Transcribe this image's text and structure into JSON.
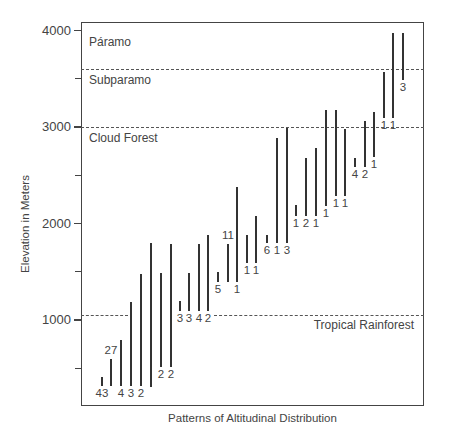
{
  "chart_data": {
    "type": "range-bar",
    "title": "",
    "xlabel": "Patterns of Altitudinal Distribution",
    "ylabel": "Elevation in Meters",
    "ylim": [
      110,
      4080
    ],
    "yticks": [
      {
        "value": 4000,
        "label": "4000"
      },
      {
        "value": 3500,
        "label": ""
      },
      {
        "value": 3000,
        "label": "3000"
      },
      {
        "value": 2500,
        "label": ""
      },
      {
        "value": 2000,
        "label": "2000"
      },
      {
        "value": 1500,
        "label": ""
      },
      {
        "value": 1000,
        "label": "1000"
      },
      {
        "value": 500,
        "label": ""
      }
    ],
    "grid": false,
    "zones": [
      {
        "name": "Páramo",
        "label_elev": 3870,
        "label_side": "left"
      },
      {
        "name": "Subparamo",
        "boundary": 3600,
        "label_elev": 3480,
        "label_side": "left"
      },
      {
        "name": "Cloud Forest",
        "boundary": 3000,
        "label_elev": 2880,
        "label_side": "left"
      },
      {
        "name": "Tropical Rainforest",
        "boundary": 1050,
        "label_elev": 940,
        "label_side": "right"
      }
    ],
    "zone_boundaries_segments": [
      {
        "elev": 3600,
        "segments": [
          [
            81,
            424
          ]
        ]
      },
      {
        "elev": 3000,
        "segments": [
          [
            81,
            424
          ]
        ]
      },
      {
        "elev": 1050,
        "segments": [
          [
            81,
            128
          ],
          [
            214,
            424
          ]
        ]
      }
    ],
    "series": [
      {
        "x": 102,
        "low": 320,
        "high": 410,
        "label": "43",
        "label_pos": "below"
      },
      {
        "x": 111,
        "low": 320,
        "high": 600,
        "label": "27",
        "label_pos": "above"
      },
      {
        "x": 121,
        "low": 320,
        "high": 790,
        "label": "4",
        "label_pos": "below"
      },
      {
        "x": 131,
        "low": 320,
        "high": 1190,
        "label": "3",
        "label_pos": "below"
      },
      {
        "x": 141,
        "low": 320,
        "high": 1480,
        "label": "2",
        "label_pos": "below"
      },
      {
        "x": 151,
        "low": 310,
        "high": 1800,
        "label": "",
        "label_pos": "below"
      },
      {
        "x": 161,
        "low": 510,
        "high": 1490,
        "label": "2",
        "label_pos": "below"
      },
      {
        "x": 171,
        "low": 510,
        "high": 1790,
        "label": "2",
        "label_pos": "below"
      },
      {
        "x": 180,
        "low": 1090,
        "high": 1200,
        "label": "3",
        "label_pos": "below"
      },
      {
        "x": 189,
        "low": 1090,
        "high": 1490,
        "label": "3",
        "label_pos": "below"
      },
      {
        "x": 199,
        "low": 1090,
        "high": 1790,
        "label": "4",
        "label_pos": "below"
      },
      {
        "x": 208,
        "low": 1090,
        "high": 1880,
        "label": "2",
        "label_pos": "below"
      },
      {
        "x": 218,
        "low": 1390,
        "high": 1500,
        "label": "5",
        "label_pos": "below"
      },
      {
        "x": 228,
        "low": 1390,
        "high": 1790,
        "label": "11",
        "label_pos": "above"
      },
      {
        "x": 237,
        "low": 1390,
        "high": 2380,
        "label": "1",
        "label_pos": "below"
      },
      {
        "x": 247,
        "low": 1590,
        "high": 1880,
        "label": "1",
        "label_pos": "below"
      },
      {
        "x": 256,
        "low": 1590,
        "high": 2080,
        "label": "1",
        "label_pos": "below"
      },
      {
        "x": 267,
        "low": 1800,
        "high": 1880,
        "label": "6",
        "label_pos": "below"
      },
      {
        "x": 277,
        "low": 1800,
        "high": 2890,
        "label": "1",
        "label_pos": "below"
      },
      {
        "x": 287,
        "low": 1800,
        "high": 2990,
        "label": "3",
        "label_pos": "below"
      },
      {
        "x": 296,
        "low": 2080,
        "high": 2190,
        "label": "1",
        "label_pos": "below"
      },
      {
        "x": 306,
        "low": 2080,
        "high": 2680,
        "label": "2",
        "label_pos": "below"
      },
      {
        "x": 316,
        "low": 2080,
        "high": 2780,
        "label": "1",
        "label_pos": "below"
      },
      {
        "x": 326,
        "low": 2180,
        "high": 3180,
        "label": "1",
        "label_pos": "below"
      },
      {
        "x": 336,
        "low": 2290,
        "high": 3180,
        "label": "1",
        "label_pos": "below"
      },
      {
        "x": 345,
        "low": 2290,
        "high": 2980,
        "label": "1",
        "label_pos": "below"
      },
      {
        "x": 355,
        "low": 2590,
        "high": 2680,
        "label": "4",
        "label_pos": "below"
      },
      {
        "x": 365,
        "low": 2590,
        "high": 3060,
        "label": "2",
        "label_pos": "below"
      },
      {
        "x": 374,
        "low": 2690,
        "high": 3160,
        "label": "1",
        "label_pos": "below"
      },
      {
        "x": 384,
        "low": 3090,
        "high": 3570,
        "label": "1",
        "label_pos": "below"
      },
      {
        "x": 393,
        "low": 3090,
        "high": 3970,
        "label": "1",
        "label_pos": "below"
      },
      {
        "x": 403,
        "low": 3490,
        "high": 3970,
        "label": "3",
        "label_pos": "below"
      }
    ]
  }
}
